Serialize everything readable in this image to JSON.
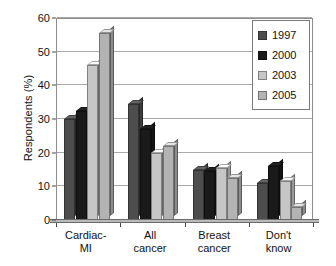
{
  "chart_data": {
    "type": "bar",
    "title": "",
    "xlabel": "",
    "ylabel": "Respondents (%)",
    "ylim": [
      0,
      60
    ],
    "yticks": [
      0,
      10,
      20,
      30,
      40,
      50,
      60
    ],
    "grid": true,
    "legend_position": "top-right",
    "categories": [
      "Cardiac-\nMI",
      "All\ncancer",
      "Breast\ncancer",
      "Don't\nknow"
    ],
    "category_lines": [
      [
        "Cardiac-",
        "MI"
      ],
      [
        "All",
        "cancer"
      ],
      [
        "Breast",
        "cancer"
      ],
      [
        "Don't",
        "know"
      ]
    ],
    "series": [
      {
        "name": "1997",
        "color": "#4d4d4d",
        "values": [
          30,
          34.5,
          15,
          11
        ]
      },
      {
        "name": "2000",
        "color": "#1a1a1a",
        "values": [
          32.5,
          27,
          14.5,
          16
        ]
      },
      {
        "name": "2003",
        "color": "#c6c6c6",
        "values": [
          46,
          20,
          15.5,
          11.5
        ]
      },
      {
        "name": "2005",
        "color": "#b3b3b3",
        "values": [
          55.5,
          22,
          12.5,
          4
        ]
      }
    ]
  },
  "axis": {
    "y_title": "Respondents (%)"
  }
}
